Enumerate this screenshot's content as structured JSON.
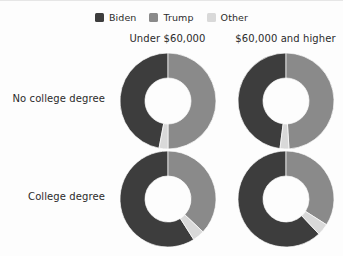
{
  "chart_data": {
    "type": "pie",
    "title": "",
    "subtitle": "",
    "variant": "donut-small-multiples",
    "legend_position": "top-center",
    "grid": false,
    "legend": [
      {
        "name": "Biden",
        "color": "#3d3d3d"
      },
      {
        "name": "Trump",
        "color": "#8a8a8a"
      },
      {
        "name": "Other",
        "color": "#d9d9d9"
      }
    ],
    "columns": [
      "Under $60,000",
      "$60,000 and higher"
    ],
    "rows": [
      "No college degree",
      "College degree"
    ],
    "categories": [
      "Biden",
      "Trump",
      "Other"
    ],
    "units": "percent",
    "panels": [
      {
        "row": "No college degree",
        "column": "Under $60,000",
        "values": [
          47,
          50,
          3
        ],
        "slices": [
          {
            "name": "Biden",
            "value": 47
          },
          {
            "name": "Trump",
            "value": 50
          },
          {
            "name": "Other",
            "value": 3
          }
        ]
      },
      {
        "row": "No college degree",
        "column": "$60,000 and higher",
        "values": [
          48,
          49,
          3
        ],
        "slices": [
          {
            "name": "Biden",
            "value": 48
          },
          {
            "name": "Trump",
            "value": 49
          },
          {
            "name": "Other",
            "value": 3
          }
        ]
      },
      {
        "row": "College degree",
        "column": "Under $60,000",
        "values": [
          59,
          37,
          4
        ],
        "slices": [
          {
            "name": "Biden",
            "value": 59
          },
          {
            "name": "Trump",
            "value": 37
          },
          {
            "name": "Other",
            "value": 4
          }
        ]
      },
      {
        "row": "College degree",
        "column": "$60,000 and higher",
        "values": [
          62,
          34,
          4
        ],
        "slices": [
          {
            "name": "Biden",
            "value": 62
          },
          {
            "name": "Trump",
            "value": 34
          },
          {
            "name": "Other",
            "value": 4
          }
        ]
      }
    ],
    "colors": {
      "biden": "#3d3d3d",
      "trump": "#8a8a8a",
      "other": "#d9d9d9",
      "background": "#fdfdfd",
      "text": "#2b2b2b"
    },
    "geometry": {
      "outer_radius": 48,
      "inner_radius": 23,
      "start_angle_deg": 0,
      "direction": "counterclockwise-biden-first"
    }
  }
}
